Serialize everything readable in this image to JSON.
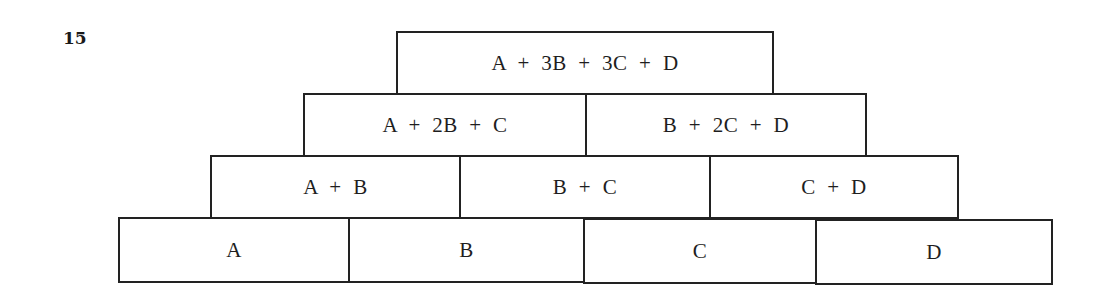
{
  "question_number": "15",
  "pyramid": {
    "rows": [
      {
        "cells": [
          "A  +  3B  +  3C  +  D"
        ]
      },
      {
        "cells": [
          "A  +  2B  +  C",
          "B  +  2C  +  D"
        ]
      },
      {
        "cells": [
          "A  +  B",
          "B  +  C",
          "C  +  D"
        ]
      },
      {
        "cells": [
          "A",
          "B",
          "C",
          "D"
        ]
      }
    ]
  }
}
